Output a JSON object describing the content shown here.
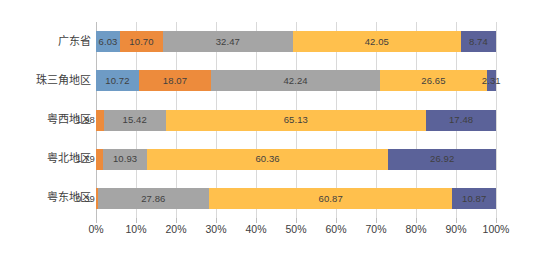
{
  "chart_data": {
    "type": "bar",
    "orientation": "horizontal",
    "stacked": true,
    "normalized": true,
    "title": "",
    "subtitle": "",
    "xlabel": "",
    "ylabel": "",
    "grid": true,
    "legend": "none",
    "xlim": [
      0,
      100
    ],
    "xticks": [
      0,
      10,
      20,
      30,
      40,
      50,
      60,
      70,
      80,
      90,
      100
    ],
    "xtick_labels": [
      "0%",
      "10%",
      "20%",
      "30%",
      "40%",
      "50%",
      "60%",
      "70%",
      "80%",
      "90%",
      "100%"
    ],
    "categories": [
      "广东省",
      "珠三角地区",
      "粤西地区",
      "粤北地区",
      "粤东地区"
    ],
    "series": [
      {
        "name": "series-1",
        "color": "#6E9BC5",
        "values": [
          6.03,
          10.72,
          0,
          0,
          0
        ]
      },
      {
        "name": "series-2",
        "color": "#ED8B3C",
        "values": [
          10.7,
          18.07,
          1.98,
          1.79,
          0.39
        ]
      },
      {
        "name": "series-3",
        "color": "#A5A5A5",
        "values": [
          32.47,
          42.24,
          15.42,
          10.93,
          27.86
        ]
      },
      {
        "name": "series-4",
        "color": "#FFC04D",
        "values": [
          42.05,
          26.65,
          65.13,
          60.36,
          60.87
        ]
      },
      {
        "name": "series-5",
        "color": "#5B6299",
        "values": [
          8.74,
          2.31,
          17.48,
          26.92,
          10.87
        ]
      }
    ],
    "bars": [
      {
        "category": "广东省",
        "segments": [
          {
            "value": 6.03,
            "label": "6.03",
            "color": "#6E9BC5",
            "label_position": "inside"
          },
          {
            "value": 10.7,
            "label": "10.70",
            "color": "#ED8B3C",
            "label_position": "inside"
          },
          {
            "value": 32.47,
            "label": "32.47",
            "color": "#A5A5A5",
            "label_position": "inside"
          },
          {
            "value": 42.05,
            "label": "42.05",
            "color": "#FFC04D",
            "label_position": "inside"
          },
          {
            "value": 8.74,
            "label": "8.74",
            "color": "#5B6299",
            "label_position": "inside"
          }
        ]
      },
      {
        "category": "珠三角地区",
        "segments": [
          {
            "value": 10.72,
            "label": "10.72",
            "color": "#6E9BC5",
            "label_position": "inside"
          },
          {
            "value": 18.07,
            "label": "18.07",
            "color": "#ED8B3C",
            "label_position": "inside"
          },
          {
            "value": 42.24,
            "label": "42.24",
            "color": "#A5A5A5",
            "label_position": "inside"
          },
          {
            "value": 26.65,
            "label": "26.65",
            "color": "#FFC04D",
            "label_position": "inside"
          },
          {
            "value": 2.31,
            "label": "2.31",
            "color": "#5B6299",
            "label_position": "inside"
          }
        ]
      },
      {
        "category": "粤西地区",
        "segments": [
          {
            "value": 0,
            "label": "",
            "color": "#6E9BC5",
            "label_position": "none"
          },
          {
            "value": 1.98,
            "label": "1.98",
            "color": "#ED8B3C",
            "label_position": "outside-left"
          },
          {
            "value": 15.42,
            "label": "15.42",
            "color": "#A5A5A5",
            "label_position": "inside"
          },
          {
            "value": 65.13,
            "label": "65.13",
            "color": "#FFC04D",
            "label_position": "inside"
          },
          {
            "value": 17.48,
            "label": "17.48",
            "color": "#5B6299",
            "label_position": "inside"
          }
        ]
      },
      {
        "category": "粤北地区",
        "segments": [
          {
            "value": 0,
            "label": "",
            "color": "#6E9BC5",
            "label_position": "none"
          },
          {
            "value": 1.79,
            "label": "1.79",
            "color": "#ED8B3C",
            "label_position": "outside-left"
          },
          {
            "value": 10.93,
            "label": "10.93",
            "color": "#A5A5A5",
            "label_position": "inside"
          },
          {
            "value": 60.36,
            "label": "60.36",
            "color": "#FFC04D",
            "label_position": "inside"
          },
          {
            "value": 26.92,
            "label": "26.92",
            "color": "#5B6299",
            "label_position": "inside"
          }
        ]
      },
      {
        "category": "粤东地区",
        "segments": [
          {
            "value": 0,
            "label": "",
            "color": "#6E9BC5",
            "label_position": "none"
          },
          {
            "value": 0.39,
            "label": "0.39",
            "color": "#ED8B3C",
            "label_position": "outside-left"
          },
          {
            "value": 27.86,
            "label": "27.86",
            "color": "#A5A5A5",
            "label_position": "inside"
          },
          {
            "value": 60.87,
            "label": "60.87",
            "color": "#FFC04D",
            "label_position": "inside"
          },
          {
            "value": 10.87,
            "label": "10.87",
            "color": "#5B6299",
            "label_position": "inside"
          }
        ]
      }
    ]
  },
  "style": {
    "gridline_color": "#d9d9d9",
    "axis_color": "#bfbfbf",
    "text_color": "#404040",
    "background": "#ffffff"
  }
}
